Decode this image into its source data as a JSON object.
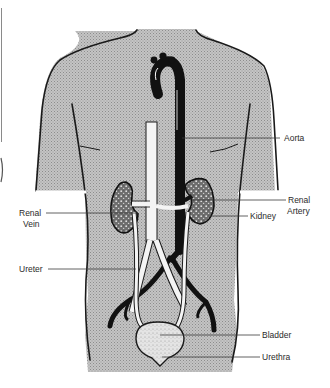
{
  "diagram": {
    "colors": {
      "background": "#ffffff",
      "torso_fill": "#bdbdbd",
      "outline": "#1a1a1a",
      "vessel_dark": "#111111",
      "vessel_light": "#f4f4f4",
      "organ_fill": "#d9d9d9",
      "label_text": "#2a2a2a"
    },
    "labels": {
      "aorta": "Aorta",
      "renal_artery_line1": "Renal",
      "renal_artery_line2": "Artery",
      "kidney": "Kidney",
      "renal_vein_line1": "Renal",
      "renal_vein_line2": "Vein",
      "ureter": "Ureter",
      "bladder": "Bladder",
      "urethra": "Urethra"
    }
  }
}
